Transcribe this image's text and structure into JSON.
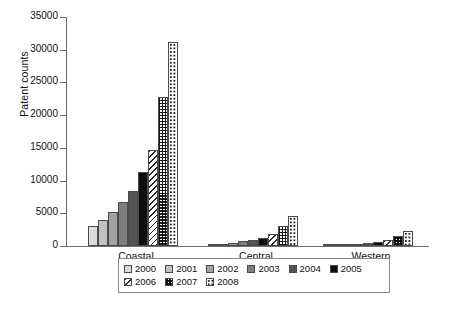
{
  "chart_data": {
    "type": "bar",
    "title": "",
    "xlabel": "",
    "ylabel": "Patent counts",
    "ylim": [
      0,
      35000
    ],
    "yticks": [
      0,
      5000,
      10000,
      15000,
      20000,
      25000,
      30000,
      35000
    ],
    "ytick_labels": [
      "0",
      "5000",
      "10000",
      "15000",
      "20000",
      "25000",
      "30000",
      "35000"
    ],
    "grid": false,
    "legend_position": "bottom",
    "categories": [
      "Coastal",
      "Central",
      "Western"
    ],
    "series": [
      {
        "name": "2000",
        "values": [
          3050,
          260,
          130
        ],
        "fill": "solid-gray",
        "color": "#dcdcdc"
      },
      {
        "name": "2001",
        "values": [
          4000,
          360,
          180
        ],
        "fill": "solid-gray",
        "color": "#c2c2c2"
      },
      {
        "name": "2002",
        "values": [
          5150,
          480,
          230
        ],
        "fill": "solid-gray",
        "color": "#a2a2a2"
      },
      {
        "name": "2003",
        "values": [
          6700,
          700,
          330
        ],
        "fill": "solid-gray",
        "color": "#7d7d7d"
      },
      {
        "name": "2004",
        "values": [
          8400,
          950,
          450
        ],
        "fill": "solid-gray",
        "color": "#545454"
      },
      {
        "name": "2005",
        "values": [
          11300,
          1300,
          620
        ],
        "fill": "solid-black",
        "color": "#0d0d0d"
      },
      {
        "name": "2006",
        "values": [
          14700,
          1800,
          900
        ],
        "fill": "diagonal-hatch",
        "color": "#ffffff"
      },
      {
        "name": "2007",
        "values": [
          22800,
          3000,
          1500
        ],
        "fill": "checkerboard",
        "color": "#ffffff"
      },
      {
        "name": "2008",
        "values": [
          31200,
          4600,
          2300
        ],
        "fill": "dotted",
        "color": "#ffffff"
      }
    ]
  },
  "axis": {
    "y_title": "Patent counts"
  },
  "legend": {
    "rows": [
      [
        "2000",
        "2001",
        "2002",
        "2003",
        "2004",
        "2005"
      ],
      [
        "2006",
        "2007",
        "2008"
      ]
    ]
  }
}
